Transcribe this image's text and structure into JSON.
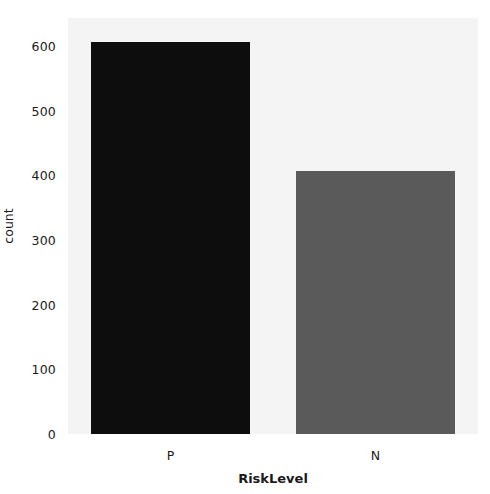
{
  "chart_data": {
    "type": "bar",
    "title": "",
    "xlabel": "RiskLevel",
    "ylabel": "count",
    "categories": [
      "P",
      "N"
    ],
    "values": [
      606,
      406
    ],
    "series": [
      {
        "name": "count",
        "values": [
          606,
          406
        ]
      }
    ],
    "yticks": [
      0,
      100,
      200,
      300,
      400,
      500,
      600
    ],
    "ytick_labels": [
      "0",
      "100",
      "200",
      "300",
      "400",
      "500",
      "600"
    ],
    "ylim": [
      0,
      643
    ],
    "xlim": [
      0,
      2
    ],
    "grid": false,
    "legend": null,
    "bar_colors": [
      "#0d0d0d",
      "#5a5a5a"
    ],
    "plot_background": "#f4f4f4",
    "figure_background": "#ffffff"
  }
}
